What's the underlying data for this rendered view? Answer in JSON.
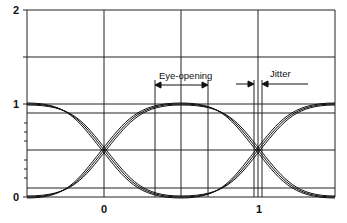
{
  "diagram": {
    "type": "eye-diagram",
    "y_axis": {
      "ticks": [
        "0",
        "1",
        "2"
      ],
      "range": [
        0,
        2
      ]
    },
    "x_axis": {
      "ticks": [
        "0",
        "1"
      ]
    },
    "annotations": {
      "eye_opening": "Eye-opening",
      "jitter": "Jitter"
    },
    "colors": {
      "line": "#111111",
      "background": "#ffffff"
    }
  }
}
